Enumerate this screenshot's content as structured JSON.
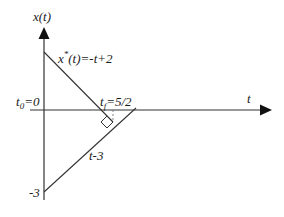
{
  "diagram": {
    "title": "",
    "axes": {
      "y_label": "x(t)",
      "x_label": "t"
    },
    "labels": {
      "optimal_prefix": "x",
      "optimal_star": "*",
      "optimal_suffix": "(t)=-t+2",
      "t0_prefix": "t",
      "t0_sub": "0",
      "t0_suffix": "=0",
      "tf_prefix": "t",
      "tf_sub": "f",
      "tf_suffix": "=5/2",
      "line2": "t-3",
      "y_intercept": "-3"
    },
    "lines": [
      {
        "name": "optimal-trajectory",
        "equation": "x*(t) = -t + 2"
      },
      {
        "name": "target-line",
        "equation": "x = t - 3"
      }
    ],
    "annotations": [
      "right-angle marker at tangency point",
      "dotted vertical from t_f"
    ],
    "colors": {
      "line": "#333333",
      "text": "#1a1a1a",
      "background": "#ffffff"
    }
  }
}
